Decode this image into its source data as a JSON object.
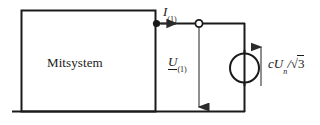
{
  "diagram": {
    "type": "single-line-circuit-schematic",
    "block": {
      "label": "Mitsystem"
    },
    "labels": {
      "current": {
        "symbol": "I",
        "subscript": "(1)",
        "full": "I(1)"
      },
      "voltage": {
        "symbol": "U",
        "subscript": "(1)",
        "full": "U(1)",
        "underlined": true
      },
      "source": {
        "prefix": "cU",
        "subscript": "n",
        "divider": "/",
        "radical": "√",
        "radicand": "3",
        "full": "cUn/√3"
      }
    },
    "elements": [
      {
        "name": "system-block",
        "shape": "rectangle"
      },
      {
        "name": "junction-dot",
        "shape": "filled-circle"
      },
      {
        "name": "terminal-node",
        "shape": "hollow-circle"
      },
      {
        "name": "voltage-source",
        "shape": "circle-with-line"
      },
      {
        "name": "current-arrow",
        "shape": "arrow-right"
      },
      {
        "name": "voltage-arrow",
        "shape": "arrow-down"
      },
      {
        "name": "source-arrow",
        "shape": "arrow-up"
      },
      {
        "name": "ground-rail",
        "shape": "horizontal-line"
      }
    ],
    "colors": {
      "line": "#1a1a1a",
      "arrow": "#3a3a3a",
      "background": "#ffffff"
    }
  }
}
